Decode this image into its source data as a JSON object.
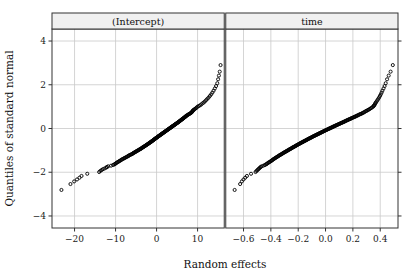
{
  "figure": {
    "width": 418,
    "height": 279,
    "background": "#ffffff",
    "xlabel": "Random effects",
    "ylabel": "Quantiles of standard normal",
    "frame_color": "#333333",
    "grid_color": "#c9c9c9",
    "strip_fill": "#f0f0f0",
    "strip_border": "#333333",
    "point_color": "#000000",
    "point_marker": "open-circle"
  },
  "chart_data": {
    "type": "scatter",
    "title": "",
    "subtitle": "",
    "xlabel": "Random effects",
    "ylabel": "Quantiles of standard normal",
    "grid": true,
    "legend": null,
    "panel_layout": "1x2",
    "shared_y_axis": true,
    "y_ticks": [
      -4,
      -2,
      0,
      2,
      4
    ],
    "y_tick_labels": [
      "-4",
      "-2",
      "0",
      "2",
      "4"
    ],
    "ylim": [
      -4.55,
      4.55
    ],
    "panels": [
      {
        "name": "intercept",
        "strip_label": "(Intercept)",
        "x_ticks": [
          -20,
          -10,
          0,
          10
        ],
        "x_tick_labels": [
          "-20",
          "-10",
          "0",
          "10"
        ],
        "xlim": [
          -25.5,
          16.5
        ],
        "n_points": 200,
        "description": "Normal Q-Q plot of random intercept effects; mildly S-shaped with heavier tails",
        "x": [
          -23.2,
          -21.0,
          -20.1,
          -19.4,
          -18.8,
          -18.3,
          -16.9,
          -14.0,
          -13.7,
          -13.4,
          -13.1,
          -12.7,
          -12.3,
          -12.1,
          -11.8,
          -11.1,
          -10.6,
          -10.3,
          -10.1,
          -9.9,
          -9.7,
          -9.5,
          -9.3,
          -9.1,
          -8.9,
          -8.7,
          -8.5,
          -8.3,
          -8.1,
          -7.9,
          -7.7,
          -7.5,
          -7.3,
          -7.1,
          -6.9,
          -6.8,
          -6.6,
          -6.4,
          -6.2,
          -6.0,
          -5.85,
          -5.7,
          -5.55,
          -5.4,
          -5.25,
          -5.1,
          -4.95,
          -4.8,
          -4.65,
          -4.5,
          -4.35,
          -4.2,
          -4.05,
          -3.9,
          -3.78,
          -3.65,
          -3.52,
          -3.4,
          -3.28,
          -3.15,
          -3.02,
          -2.9,
          -2.78,
          -2.66,
          -2.54,
          -2.42,
          -2.3,
          -2.18,
          -2.06,
          -1.95,
          -1.84,
          -1.73,
          -1.62,
          -1.51,
          -1.4,
          -1.3,
          -1.2,
          -1.1,
          -1.0,
          -0.9,
          -0.8,
          -0.7,
          -0.6,
          -0.5,
          -0.4,
          -0.3,
          -0.2,
          -0.1,
          0.0,
          0.1,
          0.2,
          0.3,
          0.4,
          0.5,
          0.6,
          0.7,
          0.8,
          0.9,
          1.0,
          1.1,
          1.2,
          1.3,
          1.4,
          1.5,
          1.6,
          1.7,
          1.8,
          1.9,
          2.0,
          2.1,
          2.2,
          2.3,
          2.4,
          2.5,
          2.6,
          2.7,
          2.8,
          2.9,
          3.0,
          3.1,
          3.2,
          3.3,
          3.4,
          3.5,
          3.6,
          3.7,
          3.8,
          3.9,
          4.0,
          4.1,
          4.2,
          4.3,
          4.4,
          4.5,
          4.6,
          4.7,
          4.8,
          4.9,
          5.0,
          5.1,
          5.2,
          5.3,
          5.4,
          5.5,
          5.6,
          5.7,
          5.8,
          5.9,
          6.0,
          6.1,
          6.2,
          6.3,
          6.4,
          6.5,
          6.6,
          6.7,
          6.8,
          6.9,
          7.0,
          7.1,
          7.2,
          7.3,
          7.45,
          7.6,
          7.75,
          7.9,
          8.05,
          8.2,
          8.35,
          8.5,
          8.6,
          8.7,
          8.8,
          8.9,
          9.0,
          9.2,
          9.4,
          9.6,
          9.8,
          10.0,
          10.3,
          10.6,
          10.9,
          11.2,
          11.5,
          11.8,
          12.1,
          12.4,
          12.7,
          13.0,
          13.3,
          13.6,
          13.9,
          14.2,
          14.5,
          14.8,
          15.0,
          15.2,
          15.4,
          15.6
        ],
        "y": [
          -2.81,
          -2.54,
          -2.42,
          -2.33,
          -2.25,
          -2.17,
          -2.07,
          -1.99,
          -1.94,
          -1.9,
          -1.86,
          -1.83,
          -1.79,
          -1.76,
          -1.73,
          -1.7,
          -1.67,
          -1.64,
          -1.62,
          -1.59,
          -1.56,
          -1.54,
          -1.52,
          -1.49,
          -1.47,
          -1.45,
          -1.42,
          -1.4,
          -1.38,
          -1.36,
          -1.34,
          -1.32,
          -1.3,
          -1.28,
          -1.26,
          -1.24,
          -1.22,
          -1.2,
          -1.19,
          -1.17,
          -1.15,
          -1.13,
          -1.11,
          -1.1,
          -1.08,
          -1.06,
          -1.05,
          -1.03,
          -1.01,
          -1.0,
          -0.98,
          -0.96,
          -0.95,
          -0.93,
          -0.92,
          -0.9,
          -0.88,
          -0.87,
          -0.85,
          -0.84,
          -0.82,
          -0.81,
          -0.79,
          -0.78,
          -0.76,
          -0.75,
          -0.73,
          -0.72,
          -0.7,
          -0.69,
          -0.67,
          -0.66,
          -0.64,
          -0.63,
          -0.62,
          -0.6,
          -0.59,
          -0.57,
          -0.56,
          -0.55,
          -0.53,
          -0.52,
          -0.5,
          -0.49,
          -0.47,
          -0.46,
          -0.45,
          -0.43,
          -0.42,
          -0.41,
          -0.39,
          -0.38,
          -0.36,
          -0.35,
          -0.34,
          -0.32,
          -0.31,
          -0.3,
          -0.28,
          -0.27,
          -0.26,
          -0.24,
          -0.23,
          -0.22,
          -0.2,
          -0.19,
          -0.18,
          -0.16,
          -0.15,
          -0.14,
          -0.12,
          -0.11,
          -0.1,
          -0.08,
          -0.07,
          -0.06,
          -0.04,
          -0.03,
          -0.02,
          0.0,
          0.01,
          0.02,
          0.04,
          0.05,
          0.06,
          0.08,
          0.09,
          0.1,
          0.12,
          0.13,
          0.14,
          0.16,
          0.17,
          0.18,
          0.2,
          0.21,
          0.22,
          0.24,
          0.25,
          0.26,
          0.28,
          0.29,
          0.3,
          0.32,
          0.33,
          0.35,
          0.36,
          0.38,
          0.39,
          0.41,
          0.42,
          0.43,
          0.45,
          0.46,
          0.48,
          0.49,
          0.51,
          0.52,
          0.54,
          0.55,
          0.57,
          0.59,
          0.6,
          0.62,
          0.64,
          0.66,
          0.67,
          0.69,
          0.71,
          0.73,
          0.75,
          0.78,
          0.8,
          0.82,
          0.85,
          0.87,
          0.9,
          0.93,
          0.96,
          1.0,
          1.03,
          1.06,
          1.1,
          1.15,
          1.19,
          1.24,
          1.3,
          1.36,
          1.42,
          1.49,
          1.56,
          1.64,
          1.73,
          1.83,
          1.94,
          2.07,
          2.25,
          2.42,
          2.6,
          2.9
        ]
      },
      {
        "name": "time",
        "strip_label": "time",
        "x_ticks": [
          -0.6,
          -0.4,
          -0.2,
          0.0,
          0.2,
          0.4
        ],
        "x_tick_labels": [
          "-0.6",
          "-0.4",
          "-0.2",
          "0.0",
          "0.2",
          "0.4"
        ],
        "xlim": [
          -0.73,
          0.53
        ],
        "n_points": 200,
        "description": "Normal Q-Q plot of random slope (time) effects; near-linear with slight tail curvature",
        "x": [
          -0.665,
          -0.625,
          -0.612,
          -0.6,
          -0.588,
          -0.575,
          -0.545,
          -0.512,
          -0.505,
          -0.498,
          -0.492,
          -0.486,
          -0.48,
          -0.474,
          -0.468,
          -0.455,
          -0.444,
          -0.436,
          -0.43,
          -0.424,
          -0.418,
          -0.412,
          -0.406,
          -0.4,
          -0.395,
          -0.39,
          -0.385,
          -0.38,
          -0.375,
          -0.37,
          -0.365,
          -0.36,
          -0.355,
          -0.35,
          -0.345,
          -0.34,
          -0.336,
          -0.331,
          -0.326,
          -0.321,
          -0.316,
          -0.312,
          -0.307,
          -0.302,
          -0.298,
          -0.293,
          -0.288,
          -0.284,
          -0.279,
          -0.275,
          -0.27,
          -0.266,
          -0.261,
          -0.257,
          -0.253,
          -0.248,
          -0.244,
          -0.24,
          -0.235,
          -0.231,
          -0.227,
          -0.222,
          -0.218,
          -0.214,
          -0.21,
          -0.205,
          -0.201,
          -0.197,
          -0.193,
          -0.188,
          -0.184,
          -0.18,
          -0.176,
          -0.171,
          -0.167,
          -0.163,
          -0.159,
          -0.154,
          -0.15,
          -0.146,
          -0.142,
          -0.137,
          -0.133,
          -0.129,
          -0.125,
          -0.12,
          -0.116,
          -0.112,
          -0.108,
          -0.103,
          -0.099,
          -0.095,
          -0.091,
          -0.086,
          -0.082,
          -0.078,
          -0.073,
          -0.069,
          -0.065,
          -0.06,
          -0.056,
          -0.052,
          -0.047,
          -0.043,
          -0.039,
          -0.034,
          -0.03,
          -0.026,
          -0.021,
          -0.017,
          -0.013,
          -0.008,
          -0.004,
          0.0,
          0.005,
          0.009,
          0.014,
          0.018,
          0.023,
          0.027,
          0.032,
          0.036,
          0.041,
          0.045,
          0.05,
          0.054,
          0.059,
          0.063,
          0.068,
          0.073,
          0.077,
          0.082,
          0.086,
          0.091,
          0.096,
          0.1,
          0.105,
          0.11,
          0.114,
          0.119,
          0.124,
          0.129,
          0.133,
          0.138,
          0.143,
          0.148,
          0.153,
          0.158,
          0.163,
          0.168,
          0.173,
          0.178,
          0.183,
          0.188,
          0.193,
          0.198,
          0.204,
          0.209,
          0.214,
          0.22,
          0.225,
          0.231,
          0.236,
          0.242,
          0.248,
          0.254,
          0.26,
          0.266,
          0.272,
          0.278,
          0.284,
          0.291,
          0.297,
          0.304,
          0.311,
          0.318,
          0.325,
          0.332,
          0.34,
          0.348,
          0.352,
          0.356,
          0.36,
          0.364,
          0.368,
          0.374,
          0.38,
          0.386,
          0.392,
          0.398,
          0.404,
          0.41,
          0.416,
          0.424,
          0.432,
          0.44,
          0.45,
          0.462,
          0.476,
          0.492
        ],
        "y": [
          -2.81,
          -2.54,
          -2.42,
          -2.33,
          -2.25,
          -2.17,
          -2.07,
          -1.99,
          -1.94,
          -1.9,
          -1.86,
          -1.83,
          -1.79,
          -1.76,
          -1.73,
          -1.7,
          -1.67,
          -1.64,
          -1.62,
          -1.59,
          -1.56,
          -1.54,
          -1.52,
          -1.49,
          -1.47,
          -1.45,
          -1.42,
          -1.4,
          -1.38,
          -1.36,
          -1.34,
          -1.32,
          -1.3,
          -1.28,
          -1.26,
          -1.24,
          -1.22,
          -1.2,
          -1.19,
          -1.17,
          -1.15,
          -1.13,
          -1.11,
          -1.1,
          -1.08,
          -1.06,
          -1.05,
          -1.03,
          -1.01,
          -1.0,
          -0.98,
          -0.96,
          -0.95,
          -0.93,
          -0.92,
          -0.9,
          -0.88,
          -0.87,
          -0.85,
          -0.84,
          -0.82,
          -0.81,
          -0.79,
          -0.78,
          -0.76,
          -0.75,
          -0.73,
          -0.72,
          -0.7,
          -0.69,
          -0.67,
          -0.66,
          -0.64,
          -0.63,
          -0.62,
          -0.6,
          -0.59,
          -0.57,
          -0.56,
          -0.55,
          -0.53,
          -0.52,
          -0.5,
          -0.49,
          -0.47,
          -0.46,
          -0.45,
          -0.43,
          -0.42,
          -0.41,
          -0.39,
          -0.38,
          -0.36,
          -0.35,
          -0.34,
          -0.32,
          -0.31,
          -0.3,
          -0.28,
          -0.27,
          -0.26,
          -0.24,
          -0.23,
          -0.22,
          -0.2,
          -0.19,
          -0.18,
          -0.16,
          -0.15,
          -0.14,
          -0.12,
          -0.11,
          -0.1,
          -0.08,
          -0.07,
          -0.06,
          -0.04,
          -0.03,
          -0.02,
          0.0,
          0.01,
          0.02,
          0.04,
          0.05,
          0.06,
          0.08,
          0.09,
          0.1,
          0.12,
          0.13,
          0.14,
          0.16,
          0.17,
          0.18,
          0.2,
          0.21,
          0.22,
          0.24,
          0.25,
          0.26,
          0.28,
          0.29,
          0.3,
          0.32,
          0.33,
          0.35,
          0.36,
          0.38,
          0.39,
          0.41,
          0.42,
          0.43,
          0.45,
          0.46,
          0.48,
          0.49,
          0.51,
          0.52,
          0.54,
          0.55,
          0.57,
          0.59,
          0.6,
          0.62,
          0.64,
          0.66,
          0.67,
          0.69,
          0.71,
          0.73,
          0.75,
          0.78,
          0.8,
          0.82,
          0.85,
          0.87,
          0.9,
          0.93,
          0.96,
          1.0,
          1.03,
          1.06,
          1.1,
          1.15,
          1.19,
          1.24,
          1.3,
          1.36,
          1.42,
          1.49,
          1.56,
          1.64,
          1.73,
          1.83,
          1.94,
          2.07,
          2.25,
          2.42,
          2.6,
          2.9
        ]
      }
    ]
  }
}
